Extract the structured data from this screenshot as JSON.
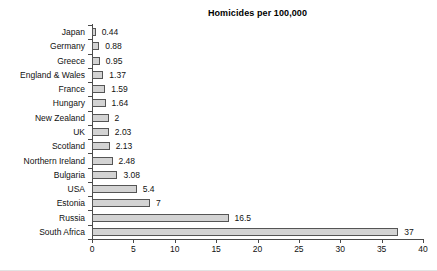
{
  "chart_data": {
    "type": "bar",
    "orientation": "horizontal",
    "title": "Homicides per 100,000",
    "xlabel": "",
    "ylabel": "",
    "xlim": [
      0,
      40
    ],
    "xticks": [
      0,
      5,
      10,
      15,
      20,
      25,
      30,
      35,
      40
    ],
    "xtick_labels": [
      "0",
      "5",
      "10",
      "15",
      "20",
      "25",
      "30",
      "35",
      "40"
    ],
    "grid": false,
    "legend": false,
    "bar_fill_color": "#d3d3d3",
    "bar_border_color": "#555555",
    "axis_color": "#4a4a4a",
    "categories": [
      "Japan",
      "Germany",
      "Greece",
      "England & Wales",
      "France",
      "Hungary",
      "New Zealand",
      "UK",
      "Scotland",
      "Northern Ireland",
      "Bulgaria",
      "USA",
      "Estonia",
      "Russia",
      "South Africa"
    ],
    "values": [
      0.44,
      0.88,
      0.95,
      1.37,
      1.59,
      1.64,
      2,
      2.03,
      2.13,
      2.48,
      3.08,
      5.4,
      7,
      16.5,
      37
    ],
    "value_labels": [
      "0.44",
      "0.88",
      "0.95",
      "1.37",
      "1.59",
      "1.64",
      "2",
      "2.03",
      "2.13",
      "2.48",
      "3.08",
      "5.4",
      "7",
      "16.5",
      "37"
    ]
  }
}
